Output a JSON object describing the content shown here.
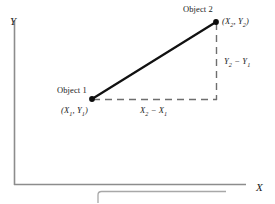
{
  "figure": {
    "axes": {
      "y_label": "Y",
      "x_label": "X"
    },
    "points": [
      {
        "name_label": "Object 1",
        "coord_label": "(X1, Y1)",
        "x": 92,
        "y": 99
      },
      {
        "name_label": "Object 2",
        "coord_label": "(X2, Y2)",
        "x": 216,
        "y": 22
      }
    ],
    "annotations": {
      "delta_x_label": "X2 − X1",
      "delta_y_label": "Y2 − Y1"
    },
    "colors": {
      "axis": "#8c8c8c",
      "connector": "#111111",
      "dashed": "#6e6e6e",
      "dot": "#0d0d0d",
      "text": "#1a1a1a",
      "caption_box": "#a8a8a8",
      "background": "#ffffff"
    }
  },
  "chart_data": {
    "type": "scatter",
    "title": "",
    "xlabel": "X",
    "ylabel": "Y",
    "series": [
      {
        "name": "Objects",
        "points": [
          {
            "label": "Object 1",
            "coord": "(X1, Y1)"
          },
          {
            "label": "Object 2",
            "coord": "(X2, Y2)"
          }
        ]
      }
    ],
    "annotations": [
      "X2 − X1",
      "Y2 − Y1"
    ],
    "grid": false,
    "legend": "none"
  }
}
